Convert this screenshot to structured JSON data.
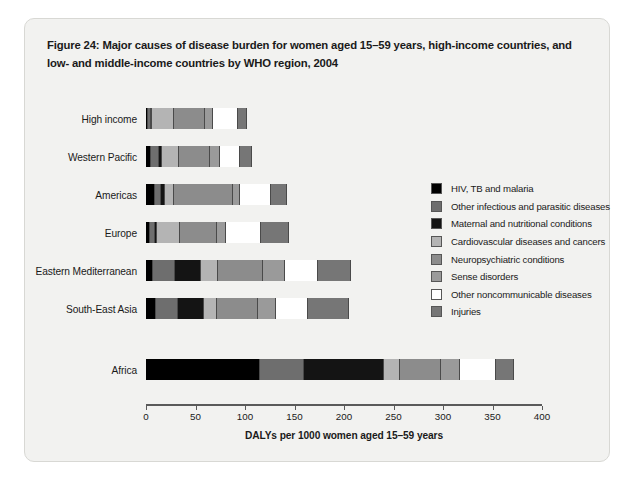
{
  "figure": {
    "title": "Figure 24: Major causes of disease burden for women aged 15–59 years, high-income countries, and low- and middle-income countries by WHO region, 2004"
  },
  "chart_data": {
    "type": "bar",
    "orientation": "horizontal",
    "stacked": true,
    "title": "Figure 24: Major causes of disease burden for women aged 15–59 years, high-income countries, and low- and middle-income countries by WHO region, 2004",
    "xlabel": "DALYs per 1000 women aged 15–59 years",
    "ylabel": "",
    "xlim": [
      0,
      400
    ],
    "xticks": [
      0,
      50,
      100,
      150,
      200,
      250,
      300,
      350,
      400
    ],
    "xtick_labels": [
      "0",
      "50",
      "100",
      "150",
      "200",
      "250",
      "300",
      "350",
      "400"
    ],
    "grid": false,
    "legend_position": "right",
    "categories": [
      "High income",
      "Western Pacific",
      "Americas",
      "Europe",
      "Eastern Mediterranean",
      "South-East Asia",
      "Africa"
    ],
    "series": [
      {
        "name": "HIV, TB and malaria",
        "color": "#000000",
        "values": [
          2,
          5,
          9,
          4,
          7,
          10,
          115
        ]
      },
      {
        "name": "Other infectious and parasitic diseases",
        "color": "#6e6e6e",
        "values": [
          3,
          8,
          6,
          5,
          22,
          22,
          45
        ]
      },
      {
        "name": "Maternal and nutritional conditions",
        "color": "#141414",
        "values": [
          1,
          3,
          4,
          2,
          27,
          27,
          80
        ]
      },
      {
        "name": "Cardiovascular diseases and cancers",
        "color": "#b4b4b4",
        "values": [
          22,
          17,
          9,
          23,
          17,
          13,
          17
        ]
      },
      {
        "name": "Neuropsychiatric conditions",
        "color": "#8c8c8c",
        "values": [
          32,
          32,
          60,
          38,
          45,
          41,
          41
        ]
      },
      {
        "name": "Sense disorders",
        "color": "#9a9a9a",
        "values": [
          8,
          10,
          7,
          9,
          22,
          18,
          19
        ]
      },
      {
        "name": "Other noncommunicable diseases",
        "color": "#ffffff",
        "values": [
          25,
          20,
          31,
          35,
          34,
          33,
          37
        ]
      },
      {
        "name": "Injuries",
        "color": "#767676",
        "values": [
          9,
          12,
          16,
          29,
          33,
          41,
          18
        ]
      }
    ],
    "totals": [
      102,
      107,
      142,
      145,
      207,
      205,
      372
    ]
  },
  "legend": {
    "items": [
      {
        "label": "HIV, TB and malaria",
        "color": "#000000"
      },
      {
        "label": "Other infectious and parasitic diseases",
        "color": "#6e6e6e"
      },
      {
        "label": "Maternal and nutritional conditions",
        "color": "#141414"
      },
      {
        "label": "Cardiovascular diseases and cancers",
        "color": "#b4b4b4"
      },
      {
        "label": "Neuropsychiatric conditions",
        "color": "#8c8c8c"
      },
      {
        "label": "Sense disorders",
        "color": "#9a9a9a"
      },
      {
        "label": "Other noncommunicable diseases",
        "color": "#ffffff"
      },
      {
        "label": "Injuries",
        "color": "#767676"
      }
    ]
  }
}
